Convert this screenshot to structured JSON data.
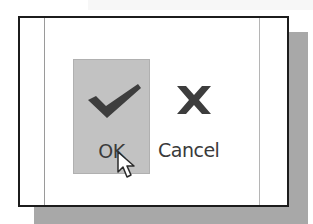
{
  "dialog": {
    "buttons": [
      {
        "label": "OK",
        "icon": "checkmark-icon",
        "state": "hovered"
      },
      {
        "label": "Cancel",
        "icon": "x-icon",
        "state": "normal"
      }
    ]
  },
  "colors": {
    "hover_background": "#c2c2c2",
    "icon_color": "#3d3d3d",
    "frame_border": "#1c1c1c",
    "shadow": "#a8a8a8"
  },
  "cursor": {
    "icon": "arrow-cursor-icon"
  }
}
